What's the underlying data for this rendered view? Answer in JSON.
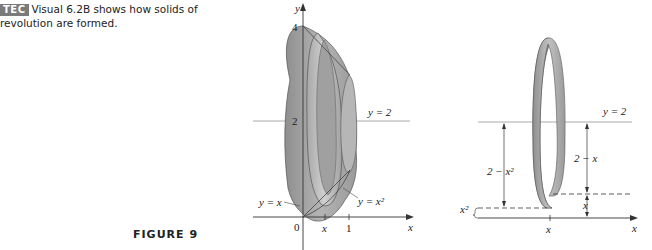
{
  "caption": {
    "badge": "TEC",
    "text_line1": "Visual 6.2B shows how solids of",
    "text_line2": "revolution are formed."
  },
  "figure": {
    "label": "FIGURE 9"
  },
  "left_diagram": {
    "y_axis_label": "y",
    "x_axis_label": "x",
    "tick_4": "4",
    "tick_2": "2",
    "origin": "0",
    "tick_x": "x",
    "tick_1": "1",
    "line_label": "y = 2",
    "curve1_label": "y = x",
    "curve2_label": "y = x²"
  },
  "right_diagram": {
    "line_label": "y = 2",
    "dim_outer": "2 − x²",
    "dim_inner": "2 − x",
    "dim_x": "x",
    "dim_x2": "x²",
    "tick_x": "x",
    "x_axis_label": "x"
  },
  "colors": {
    "solid_fill": "#9a9a9a",
    "solid_light": "#c8c8c8",
    "axis": "#333333",
    "line": "#999999",
    "badge": "#7a7a7a"
  }
}
